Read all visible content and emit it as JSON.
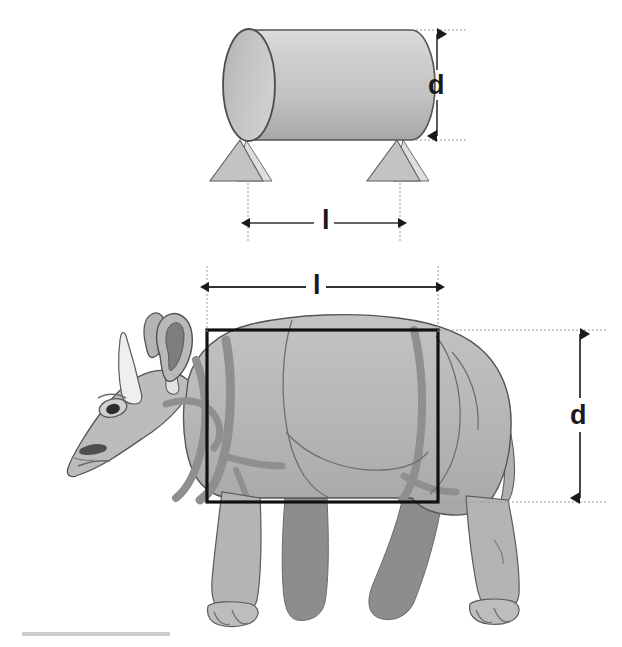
{
  "figure": {
    "background_color": "#ffffff"
  },
  "cylinder_model": {
    "name": "cylinder-diagram",
    "description": "Horizontal cylinder on two conical legs representing the rhinoceros torso",
    "diameter_label": "d",
    "length_label": "l",
    "body_fill_light": "#d2d2d2",
    "body_fill_mid": "#bdbdbd",
    "body_fill_dark": "#ababab",
    "endcap_fill": "#bdbdbd",
    "outline_color": "#4a4a4a",
    "leg_fill": "#c0c0c0",
    "leg_fill_light": "#dcdcdc"
  },
  "rhino_illustration": {
    "name": "rhinoceros-drawing",
    "species_depiction": "Indian rhinoceros, left lateral view",
    "diameter_label": "d",
    "length_label": "l",
    "body_fill": "#b6b6b6",
    "body_fill_light": "#c4c4c4",
    "body_fill_shadow": "#9a9a9a",
    "leg_far_fill": "#8d8d8d",
    "horn_fill": "#efefef",
    "fold_color": "#8f8f8f",
    "outline_color": "#555555",
    "bounding_box_color": "#111111"
  },
  "annotations": {
    "dimension_line_color": "#333333",
    "extension_line_color": "#9b9b9b",
    "arrow_fill": "#1a1a1a",
    "cylinder_d": {
      "label": "d",
      "orientation": "vertical"
    },
    "cylinder_l": {
      "label": "l",
      "orientation": "horizontal"
    },
    "rhino_l": {
      "label": "l",
      "orientation": "horizontal"
    },
    "rhino_d": {
      "label": "d",
      "orientation": "vertical"
    }
  }
}
